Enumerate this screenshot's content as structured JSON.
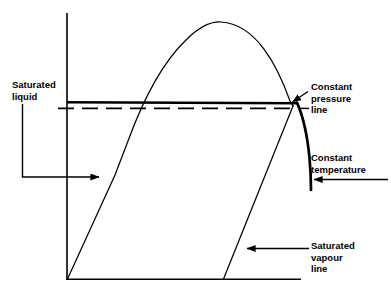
{
  "figure": {
    "type": "pressure-volume-phase-diagram",
    "background_color": "#ffffff",
    "line_color": "#000000"
  },
  "axes": {
    "y_axis_name": "vertical-axis",
    "x_axis_name": "horizontal-axis"
  },
  "curves": [
    {
      "name": "saturated-liquid-line",
      "style": "thin-solid",
      "description": "left branch of the saturation dome rising from origin"
    },
    {
      "name": "saturation-dome",
      "style": "thin-solid",
      "description": "dome shaped vapour dome peak"
    },
    {
      "name": "saturated-vapour-line",
      "style": "thin-solid",
      "description": "right branch of the saturation dome descending to the x axis"
    },
    {
      "name": "constant-pressure-line",
      "style": "thick-solid-horizontal",
      "description": "horizontal isobar across the dome"
    },
    {
      "name": "constant-temperature-line",
      "style": "dashed-horizontal-plus-thick-curve",
      "description": "dashed isotherm inside the dome continuing as a thick falling curve outside"
    }
  ],
  "labels": {
    "saturated_liquid": {
      "lines": [
        "Saturated",
        "liquid"
      ],
      "text": "Saturated\nliquid",
      "leader": "elbow-down-then-right-arrow"
    },
    "constant_pressure": {
      "lines": [
        "Constant",
        "pressure",
        "line"
      ],
      "text": "Constant\npressure\nline",
      "leader": "short-diagonal-arrow-up-left"
    },
    "constant_temperature": {
      "lines": [
        "Constant",
        "temperature"
      ],
      "text": "Constant\ntemperature",
      "leader": "horizontal-arrow-left"
    },
    "saturated_vapour": {
      "lines": [
        "Saturated",
        "vapour",
        "line"
      ],
      "text": "Saturated\nvapour\nline",
      "leader": "horizontal-arrow-left"
    }
  }
}
